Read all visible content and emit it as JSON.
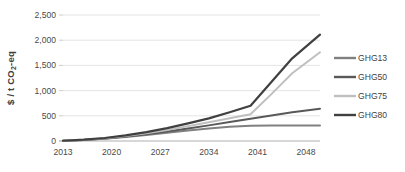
{
  "chart_data": {
    "type": "line",
    "title": "",
    "xlabel": "",
    "ylabel": "$ / t CO2-eq",
    "ylabel_parts": {
      "pre": "$ / t CO",
      "sub": "2",
      "post": "-eq"
    },
    "xlim": [
      2013,
      2050
    ],
    "ylim": [
      0,
      2500
    ],
    "ytick_values": [
      0,
      500,
      1000,
      1500,
      2000,
      2500
    ],
    "ytick_labels": [
      "0",
      "500",
      "1,000",
      "1,500",
      "2,000",
      "2,500"
    ],
    "xtick_values": [
      2013,
      2020,
      2027,
      2034,
      2041,
      2048
    ],
    "xtick_labels": [
      "2013",
      "2020",
      "2027",
      "2034",
      "2041",
      "2048"
    ],
    "grid": true,
    "grid_axis": "y",
    "legend_position": "right",
    "x": [
      2013,
      2016,
      2019,
      2022,
      2025,
      2028,
      2031,
      2034,
      2037,
      2040,
      2043,
      2046,
      2050
    ],
    "series": [
      {
        "name": "GHG13",
        "color": "#808080",
        "width": 2.0,
        "values": [
          5,
          20,
          45,
          80,
          120,
          165,
          210,
          250,
          285,
          305,
          310,
          310,
          310
        ]
      },
      {
        "name": "GHG50",
        "color": "#595959",
        "width": 2.0,
        "values": [
          5,
          22,
          50,
          90,
          135,
          190,
          250,
          310,
          375,
          440,
          505,
          570,
          640
        ]
      },
      {
        "name": "GHG75",
        "color": "#bfbfbf",
        "width": 2.0,
        "values": [
          5,
          24,
          55,
          100,
          155,
          220,
          295,
          370,
          450,
          530,
          930,
          1345,
          1760
        ]
      },
      {
        "name": "GHG80",
        "color": "#404040",
        "width": 2.2,
        "values": [
          5,
          26,
          60,
          110,
          175,
          255,
          350,
          450,
          570,
          700,
          1170,
          1640,
          2110
        ]
      }
    ],
    "legend_entries": [
      {
        "label": "GHG13",
        "color": "#808080"
      },
      {
        "label": "GHG50",
        "color": "#595959"
      },
      {
        "label": "GHG75",
        "color": "#bfbfbf"
      },
      {
        "label": "GHG80",
        "color": "#404040"
      }
    ]
  },
  "colors": {
    "background": "#ffffff",
    "gridline": "#d9d9d9",
    "axis": "#a6a6a6",
    "text": "#404040"
  }
}
